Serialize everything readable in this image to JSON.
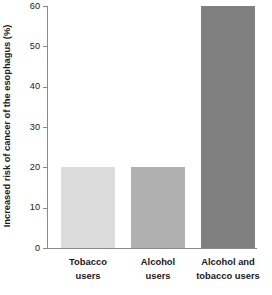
{
  "chart_data": {
    "type": "bar",
    "title": "",
    "subtitle": "",
    "xlabel": "",
    "ylabel": "Increased risk of cancer of the esophagus (%)",
    "categories": [
      "Tobacco users",
      "Alcohol users",
      "Alcohol and tobacco users"
    ],
    "category_lines": [
      [
        "Tobacco",
        "users"
      ],
      [
        "Alcohol",
        "users"
      ],
      [
        "Alcohol and",
        "tobacco users"
      ]
    ],
    "values": [
      20,
      20,
      60
    ],
    "bar_colors": [
      "#dcdcdc",
      "#b0b0b0",
      "#808080"
    ],
    "ylim": [
      0,
      60
    ],
    "yticks": [
      0,
      10,
      20,
      30,
      40,
      50,
      60
    ],
    "ytick_labels": [
      "0",
      "10",
      "20",
      "30",
      "40",
      "50",
      "60"
    ],
    "grid": false,
    "legend": false,
    "legend_position": "none",
    "axis_color": "#8a8a8a",
    "text_color": "#1a1a1a",
    "background": "#ffffff"
  }
}
